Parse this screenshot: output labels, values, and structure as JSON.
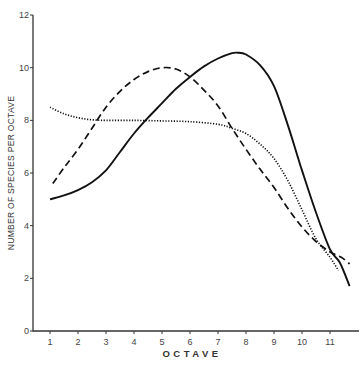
{
  "chart_data": {
    "type": "line",
    "title": "",
    "xlabel": "OCTAVE",
    "ylabel": "NUMBER OF SPECIES PER OCTAVE",
    "xlim": [
      0.6,
      11.9
    ],
    "ylim": [
      0,
      12
    ],
    "x_ticks": [
      1,
      2,
      3,
      4,
      5,
      6,
      7,
      8,
      9,
      10,
      11
    ],
    "y_ticks": [
      0,
      2,
      4,
      6,
      8,
      10,
      12
    ],
    "grid": false,
    "legend": null,
    "series": [
      {
        "name": "solid",
        "style": "solid",
        "x": [
          1,
          1.5,
          2,
          2.5,
          3,
          3.5,
          4,
          4.5,
          5,
          5.5,
          6,
          6.5,
          7,
          7.5,
          7.7,
          8,
          8.5,
          9,
          9.5,
          10,
          10.5,
          11,
          11.35,
          11.7
        ],
        "y": [
          5.0,
          5.15,
          5.35,
          5.65,
          6.1,
          6.8,
          7.5,
          8.1,
          8.65,
          9.2,
          9.65,
          10.05,
          10.35,
          10.55,
          10.57,
          10.5,
          10.1,
          9.3,
          7.8,
          6.1,
          4.5,
          3.1,
          2.6,
          1.7
        ]
      },
      {
        "name": "dashed",
        "style": "dashed",
        "x": [
          1.1,
          1.5,
          2,
          2.5,
          3,
          3.5,
          4,
          4.5,
          5,
          5.5,
          6,
          6.5,
          7,
          7.5,
          8,
          8.5,
          9,
          9.5,
          10,
          10.5,
          11,
          11.4,
          11.7
        ],
        "y": [
          5.6,
          6.2,
          6.9,
          7.7,
          8.5,
          9.1,
          9.55,
          9.85,
          10.0,
          9.95,
          9.65,
          9.15,
          8.55,
          7.7,
          6.9,
          6.15,
          5.45,
          4.65,
          3.95,
          3.4,
          3.0,
          2.8,
          2.55
        ]
      },
      {
        "name": "dotted",
        "style": "dotted",
        "x": [
          1,
          1.5,
          2,
          2.5,
          3,
          4,
          5,
          6,
          7,
          7.5,
          8,
          8.5,
          9,
          9.5,
          10,
          10.5,
          11,
          11.3
        ],
        "y": [
          8.5,
          8.25,
          8.1,
          8.02,
          8.0,
          8.0,
          7.98,
          7.95,
          7.85,
          7.7,
          7.5,
          7.1,
          6.55,
          5.7,
          4.6,
          3.5,
          2.8,
          2.3
        ]
      }
    ]
  }
}
